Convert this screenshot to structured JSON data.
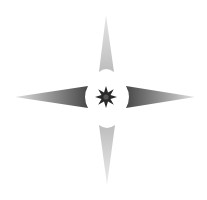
{
  "icon": {
    "name": "four-point-star-sparkle",
    "label": "Four-pointed star with central eight-point sparkle",
    "center": [
      106,
      97
    ],
    "arms": {
      "top": {
        "tip": [
          106,
          15
        ],
        "base_y": 72,
        "base_x": [
          99,
          114
        ]
      },
      "bottom": {
        "tip": [
          107,
          185
        ],
        "base_y": 125,
        "base_x": [
          99,
          115
        ]
      },
      "left": {
        "tip": [
          15,
          97
        ],
        "base_x": 88,
        "base_y": [
          86,
          108
        ]
      },
      "right": {
        "tip": [
          195,
          97
        ],
        "base_x": 126,
        "base_y": [
          86,
          108
        ]
      }
    },
    "colors": {
      "background": "#ffffff",
      "vertical_arm": "#c2c2c2",
      "horizontal_arm_dark": "#4a4a4a",
      "horizontal_arm_light": "#d8d8d8",
      "center_star": "#2a2a2a"
    }
  }
}
